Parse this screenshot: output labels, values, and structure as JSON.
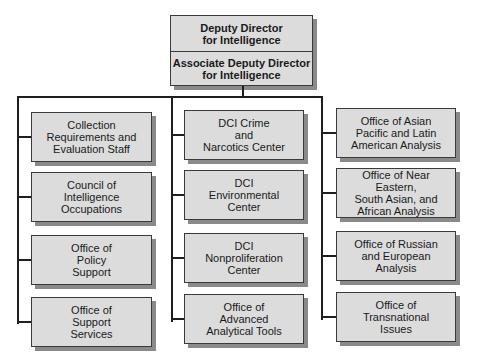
{
  "top": {
    "head": "Deputy Director\nfor Intelligence",
    "associate": "Associate Deputy Director\nfor Intelligence"
  },
  "columns": [
    {
      "units": [
        "Collection\nRequirements and\nEvaluation Staff",
        "Council of\nIntelligence\nOccupations",
        "Office of\nPolicy\nSupport",
        "Office of\nSupport\nServices"
      ]
    },
    {
      "units": [
        "DCI Crime\nand\nNarcotics Center",
        "DCI\nEnvironmental\nCenter",
        "DCI\nNonproliferation\nCenter",
        "Office of\nAdvanced\nAnalytical Tools"
      ]
    },
    {
      "units": [
        "Office of Asian\nPacific and Latin\nAmerican Analysis",
        "Office of Near Eastern,\nSouth Asian, and\nAfrican Analysis",
        "Office of Russian\nand European\nAnalysis",
        "Office of\nTransnational\nIssues"
      ]
    }
  ],
  "colors": {
    "box_fill": "#dcdcdc",
    "box_border": "#3a3a3a",
    "shadow": "#8a8a8a",
    "line": "#1e1e1e"
  }
}
